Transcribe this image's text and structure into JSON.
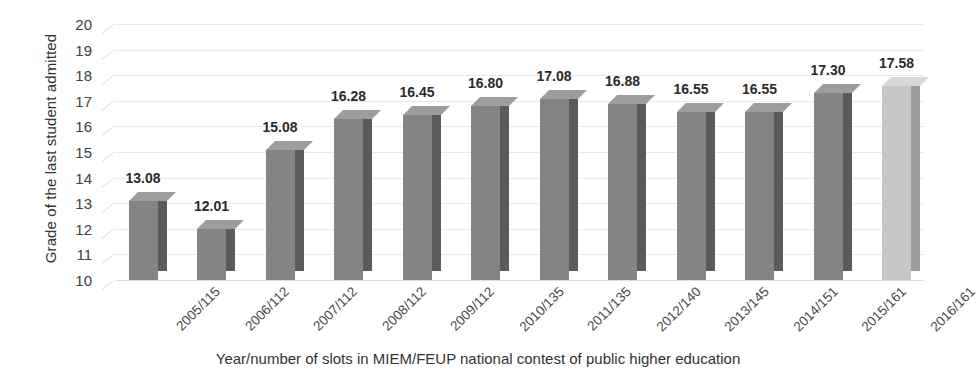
{
  "chart_data": {
    "type": "bar",
    "title": "",
    "xlabel": "Year/number of slots in MIEM/FEUP national contest of public higher education",
    "ylabel": "Grade of the last student admitted",
    "categories": [
      "2005/115",
      "2006/112",
      "2007/112",
      "2008/112",
      "2009/112",
      "2010/135",
      "2011/135",
      "2012/140",
      "2013/145",
      "2014/151",
      "2015/161",
      "2016/161"
    ],
    "values": [
      13.08,
      12.01,
      15.08,
      16.28,
      16.45,
      16.8,
      17.08,
      16.88,
      16.55,
      16.55,
      17.3,
      17.58
    ],
    "value_labels": [
      "13.08",
      "12.01",
      "15.08",
      "16.28",
      "16.45",
      "16.80",
      "17.08",
      "16.88",
      "16.55",
      "16.55",
      "17.30",
      "17.58"
    ],
    "ylim": [
      10,
      20
    ],
    "ytick_labels": [
      "20",
      "19",
      "18",
      "17",
      "16",
      "15",
      "14",
      "13",
      "12",
      "11",
      "10"
    ],
    "ytick_values": [
      20,
      19,
      18,
      17,
      16,
      15,
      14,
      13,
      12,
      11,
      10
    ],
    "grid": true,
    "legend": "none",
    "highlight_index": 11,
    "colors": {
      "bar_front": "#848484",
      "bar_side": "#5b5b5b",
      "bar_top": "#9d9d9d",
      "highlight_front": "#c6c6c6",
      "highlight_side": "#9c9c9c",
      "highlight_top": "#d8d8d8",
      "gridline": "#e9e9e9",
      "text": "#333333",
      "background": "#ffffff"
    }
  }
}
